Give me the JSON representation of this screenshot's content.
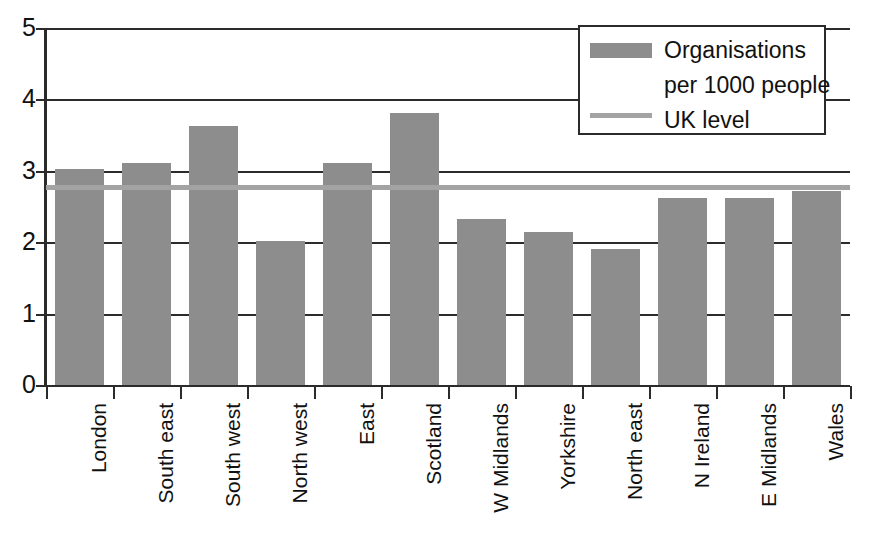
{
  "chart_data": {
    "type": "bar",
    "title": "",
    "xlabel": "",
    "ylabel": "",
    "ylim": [
      0,
      5
    ],
    "yticks": [
      "0",
      "1",
      "2",
      "3",
      "4",
      "5"
    ],
    "grid": true,
    "legend_position": "top-right",
    "categories": [
      "London",
      "South east",
      "South west",
      "North west",
      "East",
      "Scotland",
      "W Midlands",
      "Yorkshire",
      "North east",
      "N Ireland",
      "E Midlands",
      "Wales"
    ],
    "series": [
      {
        "name": "Organisations per 1000 people",
        "type": "bar",
        "color": "#8d8d8d",
        "values": [
          3.02,
          3.11,
          3.63,
          2.02,
          3.11,
          3.81,
          2.33,
          2.14,
          1.91,
          2.62,
          2.62,
          2.72
        ]
      },
      {
        "name": "UK level",
        "type": "line",
        "color": "#a3a3a3",
        "value": 2.8
      }
    ]
  },
  "legend": {
    "entry_bar_line1": "Organisations",
    "entry_bar_line2": "per 1000 people",
    "entry_line": "UK level"
  },
  "colors": {
    "bar": "#8d8d8d",
    "uk_level_line": "#a3a3a3",
    "axis": "#2b2b2b",
    "text": "#111111",
    "background": "#ffffff"
  }
}
